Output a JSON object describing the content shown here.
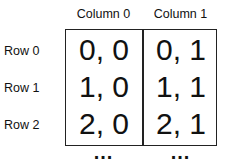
{
  "columns": [
    "Column 0",
    "Column 1"
  ],
  "rows": [
    "Row 0",
    "Row 1",
    "Row 2"
  ],
  "cells": [
    [
      "0, 0",
      "0, 1"
    ],
    [
      "1, 0",
      "1, 1"
    ],
    [
      "2, 0",
      "2, 1"
    ]
  ],
  "continuation": "..."
}
